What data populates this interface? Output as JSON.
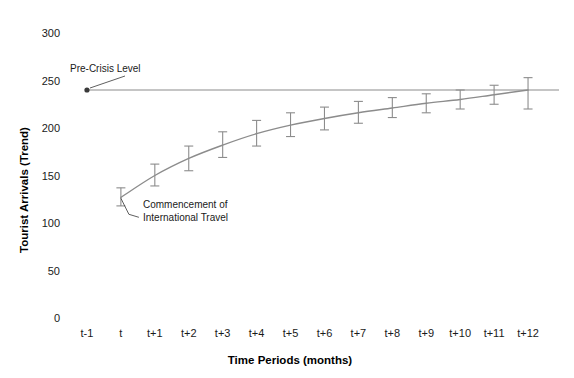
{
  "chart_data": {
    "type": "line",
    "title": "",
    "subtitle": "",
    "xlabel": "Time Periods (months)",
    "ylabel": "Tourist Arrivals (Trend)",
    "xlim": [
      -1,
      12
    ],
    "ylim": [
      0,
      300
    ],
    "grid": false,
    "legend_position": "none",
    "y_ticks": [
      0,
      50,
      100,
      150,
      200,
      250,
      300
    ],
    "y_tick_labels": [
      "0",
      "50",
      "100",
      "150",
      "200",
      "250",
      "300"
    ],
    "categories": [
      "t-1",
      "t",
      "t+1",
      "t+2",
      "t+3",
      "t+4",
      "t+5",
      "t+6",
      "t+7",
      "t+8",
      "t+9",
      "t+10",
      "t+11",
      "t+12"
    ],
    "series": [
      {
        "name": "Tourist Arrivals (Trend)",
        "color": "#8c8c8c",
        "x": [
          "t",
          "t+1",
          "t+2",
          "t+3",
          "t+4",
          "t+5",
          "t+6",
          "t+7",
          "t+8",
          "t+9",
          "t+10",
          "t+11",
          "t+12"
        ],
        "values": [
          127,
          150,
          168,
          182,
          194,
          203,
          210,
          216,
          221,
          226,
          230,
          235,
          240
        ],
        "error_low": [
          118,
          139,
          155,
          169,
          181,
          191,
          198,
          205,
          211,
          216,
          220,
          225,
          220
        ],
        "error_high": [
          137,
          162,
          181,
          196,
          208,
          216,
          222,
          228,
          232,
          236,
          240,
          245,
          253
        ]
      }
    ],
    "reference_line": {
      "name": "Pre-Crisis Level",
      "value": 240,
      "color": "#8c8c8c",
      "marker_at": "t-1"
    },
    "annotations": [
      {
        "name": "pre-crisis-level",
        "text": "Pre-Crisis Level",
        "lines": [
          "Pre-Crisis Level"
        ]
      },
      {
        "name": "commencement-of-international-travel",
        "text": "Commencement of International Travel",
        "lines": [
          "Commencement of",
          "International Travel"
        ]
      }
    ]
  },
  "axes": {
    "y_title": "Tourist Arrivals (Trend)",
    "x_title": "Time Periods (months)",
    "y_tick_labels": [
      "300",
      "250",
      "200",
      "150",
      "100",
      "50",
      "0"
    ],
    "x_tick_labels": [
      "t-1",
      "t",
      "t+1",
      "t+2",
      "t+3",
      "t+4",
      "t+5",
      "t+6",
      "t+7",
      "t+8",
      "t+9",
      "t+10",
      "t+11",
      "t+12"
    ]
  },
  "annotations": {
    "pre_crisis": "Pre-Crisis Level",
    "commencement_line1": "Commencement of",
    "commencement_line2": "International Travel"
  },
  "colors": {
    "line": "#8c8c8c",
    "reference": "#8c8c8c",
    "text": "#1a1a1a",
    "background": "#ffffff"
  }
}
